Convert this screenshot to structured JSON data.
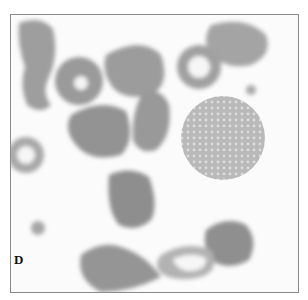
{
  "figure": {
    "panel_label": "D",
    "colors": {
      "background": "#fbfbfb",
      "cell_gray": "#9a9a9a",
      "cell_dark": "#8c8c8c",
      "border": "#8a8a8a"
    }
  }
}
